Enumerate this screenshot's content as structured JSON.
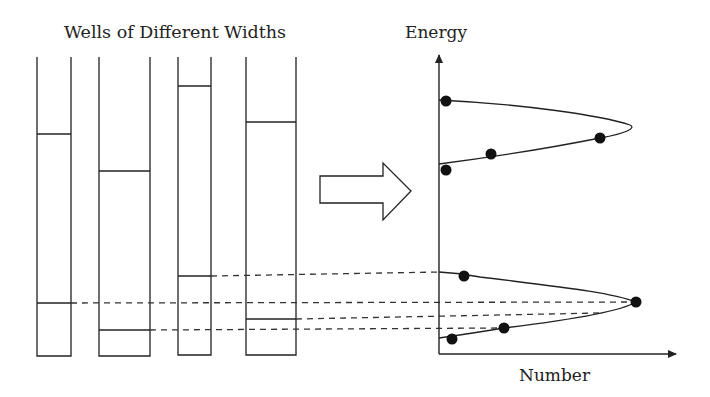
{
  "left_panel": {
    "title": "Wells of Different Widths",
    "wells": [
      {
        "name": "well-1",
        "x": 37,
        "width": 34,
        "top": 57,
        "bottom": 356,
        "levels": [
          134,
          303
        ]
      },
      {
        "name": "well-2",
        "x": 99,
        "width": 51,
        "top": 57,
        "bottom": 356,
        "levels": [
          171,
          330
        ]
      },
      {
        "name": "well-3",
        "x": 178,
        "width": 33,
        "top": 57,
        "bottom": 355,
        "levels": [
          86,
          276
        ]
      },
      {
        "name": "well-4",
        "x": 246,
        "width": 50,
        "top": 57,
        "bottom": 355,
        "levels": [
          122,
          319
        ]
      }
    ]
  },
  "transition_arrow": {
    "direction": "right"
  },
  "right_panel": {
    "y_axis_label": "Energy",
    "x_axis_label": "Number",
    "upper_band_points": [
      [
        446,
        101
      ],
      [
        491,
        154
      ],
      [
        600,
        138
      ],
      [
        446,
        170
      ]
    ],
    "lower_band_points": [
      [
        464,
        276
      ],
      [
        636,
        302
      ],
      [
        504,
        328
      ],
      [
        452,
        339
      ]
    ]
  },
  "colors": {
    "ink": "#222222",
    "background": "#ffffff"
  }
}
